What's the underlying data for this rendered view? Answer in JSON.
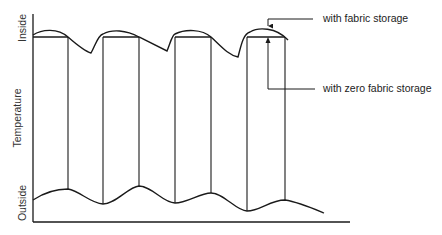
{
  "diagram": {
    "y_axis": {
      "title": "Temperature",
      "top_label": "Inside",
      "bottom_label": "Outside"
    },
    "annotations": [
      {
        "id": "upper",
        "text": "with fabric storage"
      },
      {
        "id": "lower",
        "text": "with zero fabric storage"
      }
    ],
    "stroke_color": "#1a1a1a"
  }
}
